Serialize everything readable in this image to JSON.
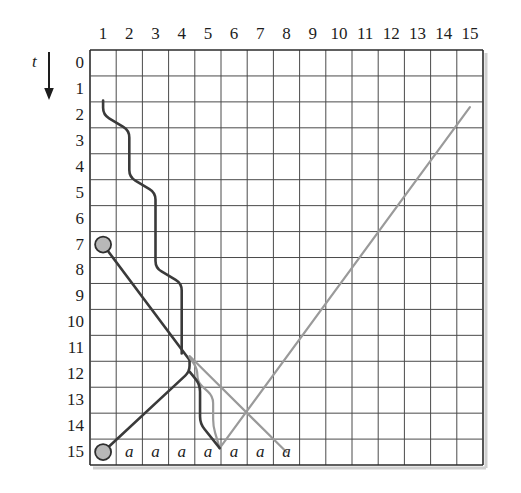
{
  "figure": {
    "kind": "space-time-diagram",
    "vertical_axis_label": "t",
    "vertical_axis_arrow": "down-arrow-icon",
    "column_labels": [
      "1",
      "2",
      "3",
      "4",
      "5",
      "6",
      "7",
      "8",
      "9",
      "10",
      "11",
      "12",
      "13",
      "14",
      "15"
    ],
    "row_labels": [
      "0",
      "1",
      "2",
      "3",
      "4",
      "5",
      "6",
      "7",
      "8",
      "9",
      "10",
      "11",
      "12",
      "13",
      "14",
      "15"
    ],
    "grid": {
      "columns": 15,
      "rows": 16,
      "x0": 90,
      "y0": 50,
      "x1": 483,
      "y1": 465,
      "cell_width": 26.2,
      "cell_height": 25.94,
      "line_color": "#4a4a4a",
      "border_color": "#2b2b2b"
    },
    "colors": {
      "dark_trace": "#3a3a3a",
      "light_trace": "#9a9a9a",
      "marker_fill": "#b8b8b8",
      "marker_stroke": "#2f2f2f",
      "text": "#1d1d1d"
    },
    "cell_letters": [
      {
        "col": 2,
        "row": 15,
        "text": "a"
      },
      {
        "col": 3,
        "row": 15,
        "text": "a"
      },
      {
        "col": 4,
        "row": 15,
        "text": "a"
      },
      {
        "col": 5,
        "row": 15,
        "text": "a"
      },
      {
        "col": 6,
        "row": 15,
        "text": "a"
      },
      {
        "col": 7,
        "row": 15,
        "text": "a"
      },
      {
        "col": 8,
        "row": 15,
        "text": "a"
      }
    ],
    "markers": [
      {
        "name": "marker-start",
        "col": 1,
        "row": 7,
        "radius": 8
      },
      {
        "name": "marker-end",
        "col": 1,
        "row": 15,
        "radius": 8
      }
    ],
    "traces": [
      {
        "name": "dark-descending-staircase",
        "style": "dark",
        "width": 2.6,
        "points": [
          [
            1,
            1.45
          ],
          [
            1,
            2.0
          ],
          [
            2,
            2.6
          ],
          [
            2,
            4.4
          ],
          [
            3,
            5.0
          ],
          [
            3,
            7.9
          ],
          [
            4,
            8.5
          ],
          [
            4,
            11.2
          ]
        ]
      },
      {
        "name": "dark-diagonal-outbound",
        "style": "dark",
        "width": 2.6,
        "points": [
          [
            1,
            7.0
          ],
          [
            4.3,
            11.45
          ]
        ]
      },
      {
        "name": "dark-diagonal-return",
        "style": "dark",
        "width": 2.6,
        "points": [
          [
            4.3,
            11.45
          ],
          [
            4.3,
            11.9
          ],
          [
            1,
            15.0
          ]
        ]
      },
      {
        "name": "light-diagonal-ascending",
        "style": "light",
        "width": 2.2,
        "points": [
          [
            5.45,
            14.85
          ],
          [
            15.0,
            1.7
          ]
        ]
      },
      {
        "name": "light-diagonal-descending",
        "style": "light",
        "width": 2.2,
        "points": [
          [
            4.3,
            11.3
          ],
          [
            8.0,
            15.0
          ]
        ]
      },
      {
        "name": "light-descending-staircase",
        "style": "light",
        "width": 2.2,
        "points": [
          [
            4.3,
            11.35
          ],
          [
            4.6,
            11.8
          ],
          [
            4.6,
            12.3
          ],
          [
            5.2,
            12.85
          ],
          [
            5.2,
            14.0
          ],
          [
            5.45,
            14.85
          ]
        ]
      },
      {
        "name": "dark-short-staircase-lower",
        "style": "dark",
        "width": 2.6,
        "points": [
          [
            4.3,
            11.9
          ],
          [
            4.7,
            12.4
          ],
          [
            4.7,
            13.9
          ],
          [
            5.45,
            14.85
          ]
        ]
      }
    ]
  }
}
